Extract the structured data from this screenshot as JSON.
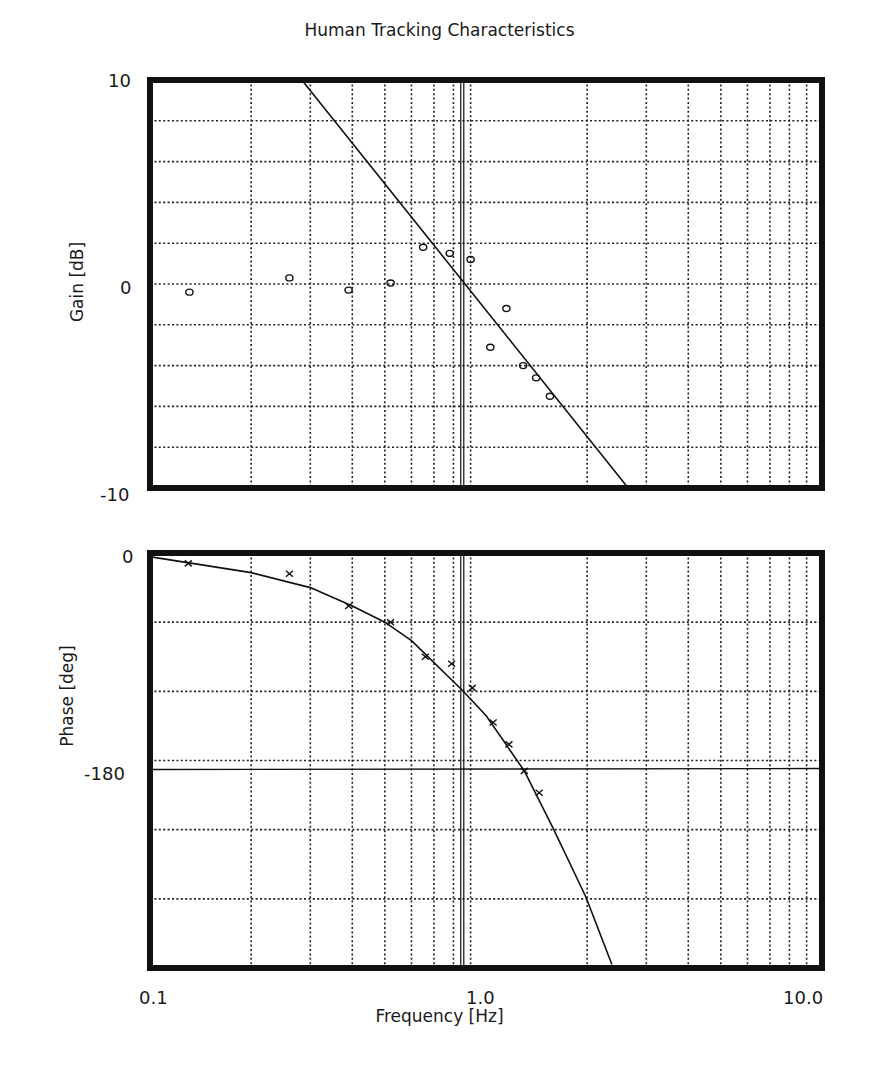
{
  "title": "Human Tracking Characteristics",
  "caption": "",
  "axes": {
    "x_label": "Frequency  [Hz]",
    "x_ticks": [
      "0.1",
      "1.0",
      "10.0"
    ],
    "gain_label": "Gain  [dB]",
    "gain_ticks": [
      "10",
      "0",
      "-10"
    ],
    "phase_label": "Phase  [deg]",
    "phase_ticks": [
      "0",
      "-180"
    ]
  },
  "colors": {
    "ink": "#111111",
    "grid": "#222222",
    "background": "#ffffff"
  },
  "chart_data": [
    {
      "type": "scatter",
      "title": "Human Tracking Characteristics",
      "xlabel": "Frequency [Hz]",
      "ylabel": "Gain [dB]",
      "xscale": "log",
      "xlim": [
        0.1,
        10.0
      ],
      "ylim": [
        -10,
        10
      ],
      "grid": true,
      "series": [
        {
          "name": "Measured gain",
          "marker": "o",
          "x": [
            0.131,
            0.26,
            0.39,
            0.52,
            0.65,
            0.78,
            0.9,
            1.03,
            1.15,
            1.29,
            1.41,
            1.55
          ],
          "y": [
            -0.4,
            0.3,
            -0.3,
            0.05,
            1.8,
            1.5,
            1.2,
            -3.1,
            -1.2,
            -4.0,
            -4.6,
            -5.5
          ]
        },
        {
          "name": "Model gain (-20 dB/dec)",
          "style": "line",
          "x": [
            0.283,
            2.65
          ],
          "y": [
            10,
            -10
          ]
        }
      ],
      "annotations": [
        {
          "type": "vline",
          "x": 0.85,
          "label": "crossover frequency"
        }
      ]
    },
    {
      "type": "scatter",
      "xlabel": "Frequency [Hz]",
      "ylabel": "Phase [deg]",
      "xscale": "log",
      "xlim": [
        0.1,
        10.0
      ],
      "ylim": [
        -360,
        0
      ],
      "grid": true,
      "series": [
        {
          "name": "Measured phase",
          "marker": "x",
          "x": [
            0.13,
            0.26,
            0.39,
            0.52,
            0.66,
            0.79,
            0.91,
            1.05,
            1.17,
            1.3,
            1.44
          ],
          "y": [
            -9,
            -18,
            -46,
            -60,
            -90,
            -96,
            -117,
            -147,
            -166,
            -189,
            -208
          ]
        },
        {
          "name": "Model phase",
          "style": "line",
          "x": [
            0.1,
            0.104,
            0.2,
            0.3,
            0.4,
            0.5,
            0.6,
            0.85,
            1.0,
            1.3,
            1.58,
            1.98,
            2.37
          ],
          "y": [
            -3,
            -4,
            -17,
            -30,
            -46,
            -60,
            -76,
            -119,
            -141,
            -189,
            -238,
            -298,
            -357
          ]
        }
      ],
      "annotations": [
        {
          "type": "hline",
          "y": -180
        },
        {
          "type": "vline",
          "x": 0.85,
          "label": "crossover frequency"
        }
      ]
    }
  ]
}
